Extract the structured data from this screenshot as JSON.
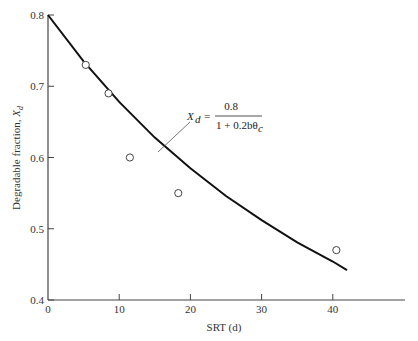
{
  "chart_data": {
    "type": "scatter",
    "title": "",
    "xlabel": "SRT (d)",
    "ylabel": "Degradable fraction, X_d",
    "ylabel_parts": {
      "text": "Degradable fraction, ",
      "var": "X",
      "sub": "d"
    },
    "xlim": [
      0,
      47
    ],
    "ylim": [
      0.4,
      0.8
    ],
    "x_ticks": [
      0,
      10,
      20,
      30,
      40
    ],
    "x_tick_labels": [
      "0",
      "10",
      "20",
      "30",
      "40"
    ],
    "y_ticks": [
      0.4,
      0.5,
      0.6,
      0.7,
      0.8
    ],
    "y_tick_labels": [
      "0.4",
      "0.5",
      "0.6",
      "0.7",
      "0.8"
    ],
    "grid": false,
    "legend": null,
    "series": [
      {
        "name": "Observed data",
        "type": "scatter",
        "marker": "open-circle",
        "x": [
          5.3,
          8.5,
          11.5,
          18.3,
          40.5
        ],
        "y": [
          0.73,
          0.69,
          0.6,
          0.55,
          0.47
        ]
      },
      {
        "name": "Model curve",
        "type": "line",
        "equation": "X_d = 0.8 / (1 + 0.2 b θc)",
        "x": [
          0,
          5,
          10,
          15,
          20,
          25,
          30,
          35,
          40,
          42
        ],
        "y": [
          0.8,
          0.735,
          0.678,
          0.628,
          0.585,
          0.546,
          0.512,
          0.481,
          0.454,
          0.442
        ]
      }
    ],
    "annotations": [
      {
        "text": "X_d = 0.8 / (1 + 0.2bθc)",
        "lhs_var": "X",
        "lhs_sub": "d",
        "equals": "=",
        "numerator": "0.8",
        "denominator": "1 + 0.2bθ",
        "denominator_sub": "c",
        "points_to": {
          "x": 15.5,
          "y": 0.615
        }
      }
    ]
  }
}
